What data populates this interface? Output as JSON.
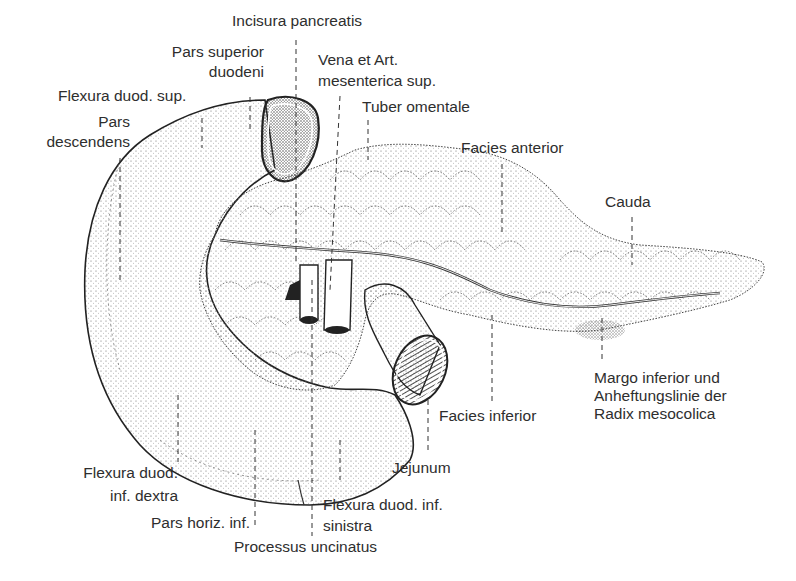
{
  "figure": {
    "labels": {
      "incisura_pancreatis": "Incisura pancreatis",
      "pars_superior_1": "Pars superior",
      "pars_superior_2": "duodeni",
      "vena_art_1": "Vena et Art.",
      "vena_art_2": "mesenterica sup.",
      "flexura_sup": "Flexura duod. sup.",
      "pars_desc_1": "Pars",
      "pars_desc_2": "descendens",
      "tuber_omentale": "Tuber omentale",
      "facies_anterior": "Facies anterior",
      "cauda": "Cauda",
      "margo_1": "Margo inferior und",
      "margo_2": "Anheftungslinie der",
      "margo_3": "Radix mesocolica",
      "facies_inferior": "Facies inferior",
      "jejunum": "Jejunum",
      "flexura_inf_dextra_1": "Flexura duod.",
      "flexura_inf_dextra_2": "inf. dextra",
      "pars_horiz": "Pars horiz. inf.",
      "flexura_inf_sin_1": "Flexura duod. inf.",
      "flexura_inf_sin_2": "sinistra",
      "processus": "Processus uncinatus"
    },
    "colors": {
      "ink": "#2a2a2a",
      "background": "#ffffff",
      "stipple": "#555555"
    }
  }
}
